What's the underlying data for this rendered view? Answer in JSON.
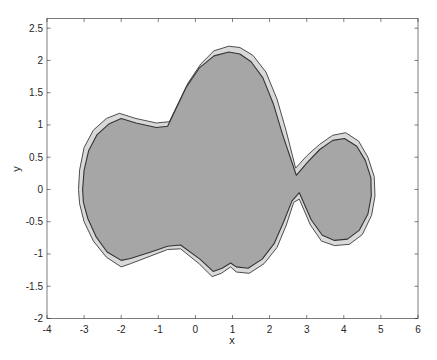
{
  "chart_data": {
    "type": "area",
    "title": "",
    "xlabel": "x",
    "ylabel": "y",
    "xlim": [
      -4,
      6
    ],
    "ylim": [
      -2,
      2.65
    ],
    "grid": false,
    "legend": null,
    "x_ticks": [
      -4,
      -3,
      -2,
      -1,
      0,
      1,
      2,
      3,
      4,
      5,
      6
    ],
    "x_tick_labels": [
      "-4",
      "-3",
      "-2",
      "-1",
      "0",
      "1",
      "2",
      "3",
      "4",
      "5",
      "6"
    ],
    "y_ticks": [
      -2,
      -1.5,
      -1,
      -0.5,
      0,
      0.5,
      1,
      1.5,
      2,
      2.5
    ],
    "y_tick_labels": [
      "-2",
      "-1.5",
      "-1",
      "-0.5",
      "0",
      "0.5",
      "1",
      "1.5",
      "2",
      "2.5"
    ],
    "series": [
      {
        "name": "outer region",
        "fill": "#d9d9d9",
        "edge": "#4d4d4d",
        "points": [
          [
            -3.15,
            0.0
          ],
          [
            -3.12,
            0.3
          ],
          [
            -3.0,
            0.65
          ],
          [
            -2.75,
            0.92
          ],
          [
            -2.4,
            1.1
          ],
          [
            -2.05,
            1.18
          ],
          [
            -1.6,
            1.1
          ],
          [
            -1.05,
            1.03
          ],
          [
            -0.7,
            1.05
          ],
          [
            -0.45,
            1.35
          ],
          [
            -0.2,
            1.65
          ],
          [
            0.15,
            1.95
          ],
          [
            0.5,
            2.15
          ],
          [
            0.9,
            2.22
          ],
          [
            1.2,
            2.2
          ],
          [
            1.55,
            2.08
          ],
          [
            1.9,
            1.82
          ],
          [
            2.2,
            1.4
          ],
          [
            2.45,
            0.9
          ],
          [
            2.7,
            0.33
          ],
          [
            3.0,
            0.52
          ],
          [
            3.35,
            0.7
          ],
          [
            3.7,
            0.84
          ],
          [
            4.05,
            0.88
          ],
          [
            4.4,
            0.75
          ],
          [
            4.65,
            0.5
          ],
          [
            4.82,
            0.2
          ],
          [
            4.84,
            -0.1
          ],
          [
            4.75,
            -0.4
          ],
          [
            4.5,
            -0.7
          ],
          [
            4.15,
            -0.85
          ],
          [
            3.75,
            -0.87
          ],
          [
            3.4,
            -0.8
          ],
          [
            3.1,
            -0.55
          ],
          [
            2.8,
            -0.15
          ],
          [
            2.65,
            -0.2
          ],
          [
            2.45,
            -0.55
          ],
          [
            2.2,
            -0.9
          ],
          [
            1.85,
            -1.15
          ],
          [
            1.45,
            -1.3
          ],
          [
            1.1,
            -1.28
          ],
          [
            0.95,
            -1.2
          ],
          [
            0.7,
            -1.3
          ],
          [
            0.45,
            -1.35
          ],
          [
            0.1,
            -1.15
          ],
          [
            -0.4,
            -0.92
          ],
          [
            -0.75,
            -0.93
          ],
          [
            -1.2,
            -1.03
          ],
          [
            -1.75,
            -1.15
          ],
          [
            -2.0,
            -1.2
          ],
          [
            -2.4,
            -1.05
          ],
          [
            -2.75,
            -0.8
          ],
          [
            -3.0,
            -0.5
          ],
          [
            -3.12,
            -0.22
          ]
        ]
      },
      {
        "name": "inner region",
        "fill": "#a6a6a6",
        "edge": "#333333",
        "points": [
          [
            -3.04,
            0.0
          ],
          [
            -3.0,
            0.3
          ],
          [
            -2.88,
            0.6
          ],
          [
            -2.65,
            0.85
          ],
          [
            -2.32,
            1.02
          ],
          [
            -2.0,
            1.1
          ],
          [
            -1.6,
            1.03
          ],
          [
            -1.05,
            0.96
          ],
          [
            -0.75,
            0.98
          ],
          [
            -0.5,
            1.28
          ],
          [
            -0.25,
            1.58
          ],
          [
            0.1,
            1.88
          ],
          [
            0.5,
            2.07
          ],
          [
            0.9,
            2.13
          ],
          [
            1.2,
            2.1
          ],
          [
            1.5,
            1.98
          ],
          [
            1.82,
            1.73
          ],
          [
            2.1,
            1.33
          ],
          [
            2.35,
            0.85
          ],
          [
            2.72,
            0.22
          ],
          [
            3.02,
            0.42
          ],
          [
            3.35,
            0.62
          ],
          [
            3.7,
            0.76
          ],
          [
            4.02,
            0.79
          ],
          [
            4.35,
            0.67
          ],
          [
            4.58,
            0.45
          ],
          [
            4.73,
            0.18
          ],
          [
            4.74,
            -0.1
          ],
          [
            4.65,
            -0.38
          ],
          [
            4.42,
            -0.63
          ],
          [
            4.1,
            -0.77
          ],
          [
            3.75,
            -0.79
          ],
          [
            3.42,
            -0.71
          ],
          [
            3.12,
            -0.47
          ],
          [
            2.8,
            -0.05
          ],
          [
            2.6,
            -0.18
          ],
          [
            2.38,
            -0.5
          ],
          [
            2.12,
            -0.84
          ],
          [
            1.8,
            -1.08
          ],
          [
            1.42,
            -1.22
          ],
          [
            1.1,
            -1.2
          ],
          [
            0.95,
            -1.14
          ],
          [
            0.72,
            -1.22
          ],
          [
            0.48,
            -1.27
          ],
          [
            0.12,
            -1.08
          ],
          [
            -0.4,
            -0.86
          ],
          [
            -0.75,
            -0.88
          ],
          [
            -1.2,
            -0.97
          ],
          [
            -1.75,
            -1.07
          ],
          [
            -2.0,
            -1.1
          ],
          [
            -2.38,
            -0.97
          ],
          [
            -2.68,
            -0.73
          ],
          [
            -2.9,
            -0.45
          ],
          [
            -3.02,
            -0.2
          ]
        ]
      }
    ]
  },
  "axes": {
    "x_label": "x",
    "y_label": "y"
  }
}
